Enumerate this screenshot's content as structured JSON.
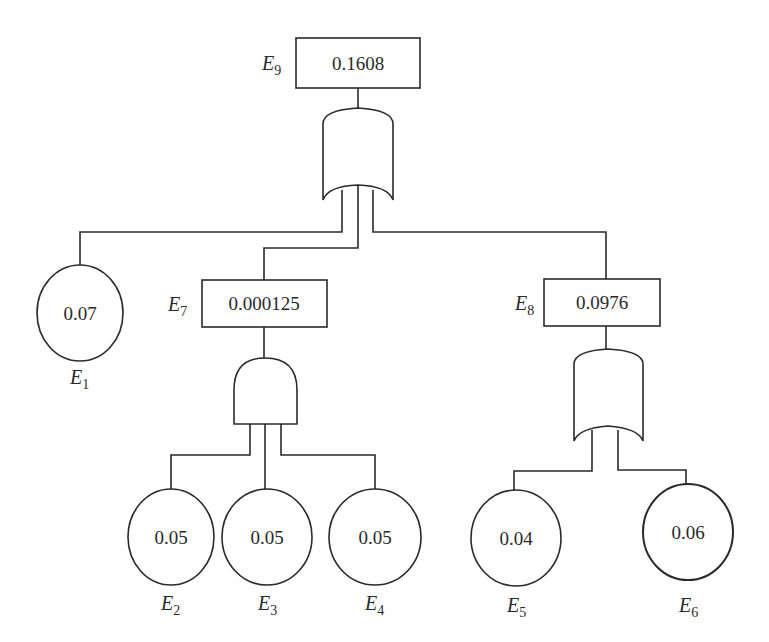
{
  "diagram": {
    "type": "fault-tree",
    "top_event": {
      "id": "E9",
      "label": "E",
      "sub": "9",
      "value": "0.1608",
      "gate": "OR"
    },
    "intermediate_events": [
      {
        "id": "E7",
        "label": "E",
        "sub": "7",
        "value": "0.000125",
        "gate": "AND"
      },
      {
        "id": "E8",
        "label": "E",
        "sub": "8",
        "value": "0.0976",
        "gate": "OR"
      }
    ],
    "basic_events": [
      {
        "id": "E1",
        "label": "E",
        "sub": "1",
        "value": "0.07",
        "parent": "E9"
      },
      {
        "id": "E2",
        "label": "E",
        "sub": "2",
        "value": "0.05",
        "parent": "E7"
      },
      {
        "id": "E3",
        "label": "E",
        "sub": "3",
        "value": "0.05",
        "parent": "E7"
      },
      {
        "id": "E4",
        "label": "E",
        "sub": "4",
        "value": "0.05",
        "parent": "E7"
      },
      {
        "id": "E5",
        "label": "E",
        "sub": "5",
        "value": "0.04",
        "parent": "E8"
      },
      {
        "id": "E6",
        "label": "E",
        "sub": "6",
        "value": "0.06",
        "parent": "E8"
      }
    ],
    "colors": {
      "stroke": "#2a2a2a",
      "background": "#ffffff"
    }
  }
}
